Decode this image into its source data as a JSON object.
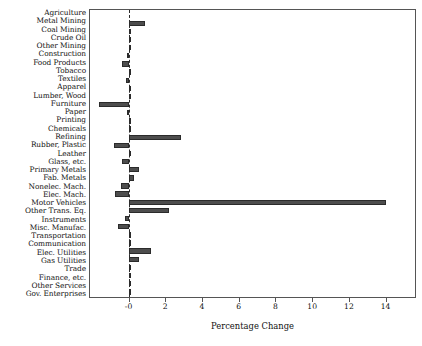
{
  "chart_data": {
    "type": "bar",
    "orientation": "horizontal",
    "title": "",
    "xlabel": "Percentage Change",
    "ylabel": "",
    "xlim": [
      -2.1,
      15.6
    ],
    "xticks": [
      0,
      2,
      4,
      6,
      8,
      10,
      12,
      14
    ],
    "xticklabels": [
      "-0",
      "2",
      "4",
      "6",
      "8",
      "10",
      "12",
      "14"
    ],
    "grid": false,
    "legend": null,
    "zero_reference_line": 0,
    "bar_color": "#4d4d4d",
    "categories": [
      "Agriculture",
      "Metal Mining",
      "Coal Mining",
      "Crude Oil",
      "Other Mining",
      "Construction",
      "Food Products",
      "Tobacco",
      "Textiles",
      "Apparel",
      "Lumber, Wood",
      "Furniture",
      "Paper",
      "Printing",
      "Chemicals",
      "Refining",
      "Rubber, Plastic",
      "Leather",
      "Glass, etc.",
      "Primary Metals",
      "Fab. Metals",
      "Nonelec. Mach.",
      "Elec. Mach.",
      "Motor Vehicles",
      "Other Trans. Eq.",
      "Instruments",
      "Misc. Manufac.",
      "Transportation",
      "Communication",
      "Elec. Utilities",
      "Gas Utilities",
      "Trade",
      "Finance, etc.",
      "Other Services",
      "Gov. Enterprises"
    ],
    "values": [
      0.0,
      0.92,
      0.04,
      0.02,
      0.02,
      -0.06,
      -0.36,
      0.02,
      -0.16,
      0.02,
      0.03,
      -1.62,
      -0.06,
      0.1,
      0.06,
      2.86,
      -0.78,
      0.02,
      -0.34,
      0.56,
      0.3,
      -0.42,
      -0.76,
      14.0,
      2.22,
      -0.22,
      -0.56,
      0.06,
      0.16,
      1.2,
      0.56,
      0.02,
      0.06,
      0.03,
      0.05
    ]
  }
}
